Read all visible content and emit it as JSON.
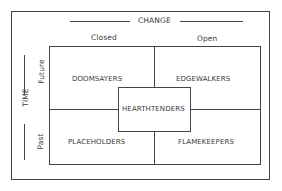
{
  "diagram": {
    "axes": {
      "horizontal": {
        "label": "CHANGE",
        "left": "Closed",
        "right": "Open"
      },
      "vertical": {
        "label": "TIME",
        "top": "Future",
        "bottom": "Past"
      }
    },
    "quadrants": {
      "top_left": "DOOMSAYERS",
      "top_right": "EDGEWALKERS",
      "bottom_left": "PLACEHOLDERS",
      "bottom_right": "FLAMEKEEPERS",
      "center": "HEARTHTENDERS"
    }
  }
}
